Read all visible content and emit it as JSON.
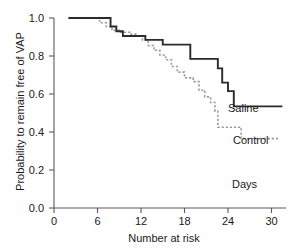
{
  "chart_data": {
    "type": "line",
    "subtype": "kaplan-meier-step",
    "title": "",
    "xlabel": "Number at risk",
    "ylabel": "Probability to remain free of VAP",
    "x_axis_annotation": "Days",
    "xlim": [
      0,
      32
    ],
    "ylim": [
      0.0,
      1.0
    ],
    "grid": false,
    "legend_position": "inline-right",
    "xticks": [
      0,
      6,
      12,
      18,
      24,
      30
    ],
    "xtick_labels": [
      "0",
      "6",
      "12",
      "18",
      "24",
      "30"
    ],
    "yticks": [
      0.0,
      0.2,
      0.4,
      0.6,
      0.8,
      1.0
    ],
    "ytick_labels": [
      "0.0",
      "0.2",
      "0.4",
      "0.6",
      "0.8",
      "1.0"
    ],
    "series": [
      {
        "name": "Saline",
        "style": "solid",
        "color": "#2b2b2b",
        "x": [
          2.0,
          7.0,
          7.8,
          8.6,
          9.5,
          11.8,
          12.6,
          14.2,
          15.0,
          18.0,
          18.8,
          21.8,
          22.6,
          23.2,
          24.0,
          24.8,
          31.5
        ],
        "y": [
          1.0,
          1.0,
          0.955,
          0.93,
          0.905,
          0.905,
          0.885,
          0.885,
          0.86,
          0.86,
          0.785,
          0.785,
          0.735,
          0.66,
          0.615,
          0.535,
          0.535
        ],
        "final_value": 0.535
      },
      {
        "name": "Control",
        "style": "dashed",
        "color": "#9a9a9a",
        "x": [
          2.0,
          5.5,
          6.3,
          7.2,
          8.0,
          9.0,
          10.5,
          11.5,
          12.2,
          13.0,
          13.8,
          14.6,
          15.4,
          16.2,
          17.0,
          18.0,
          19.2,
          20.0,
          20.8,
          21.6,
          22.2,
          22.6,
          25.0,
          25.8,
          31.0
        ],
        "y": [
          1.0,
          1.0,
          0.975,
          0.955,
          0.935,
          0.925,
          0.915,
          0.905,
          0.885,
          0.855,
          0.83,
          0.805,
          0.78,
          0.745,
          0.715,
          0.685,
          0.665,
          0.62,
          0.585,
          0.555,
          0.51,
          0.425,
          0.425,
          0.365,
          0.365
        ],
        "final_value": 0.365
      }
    ]
  },
  "labels": {
    "saline": "Saline",
    "control": "Control",
    "days": "Days"
  }
}
